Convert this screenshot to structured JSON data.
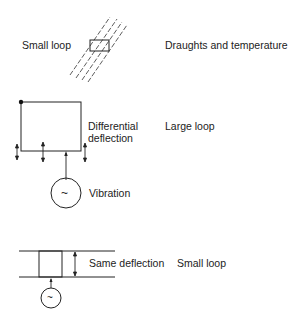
{
  "panels": [
    {
      "id": "draughts",
      "left_label": "Small loop",
      "cause": "Draughts and temperature"
    },
    {
      "id": "vibration-large",
      "deflection_label_line1": "Differential",
      "deflection_label_line2": "deflection",
      "loop_label": "Large loop",
      "source_label": "Vibration",
      "source_symbol": "~"
    },
    {
      "id": "vibration-small",
      "deflection_label": "Same deflection",
      "loop_label": "Small loop",
      "source_symbol": "~"
    }
  ]
}
